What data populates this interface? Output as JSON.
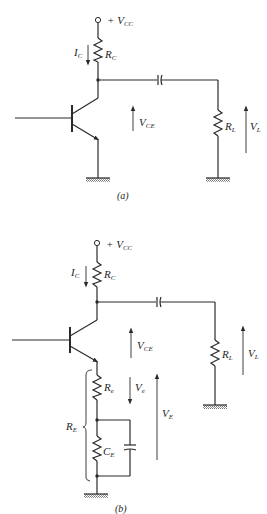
{
  "header": {
    "text": "Fig."
  },
  "figures": [
    {
      "id": "a",
      "caption": "(a)",
      "labels": {
        "vcc": {
          "main": "+ V",
          "sub": "CC"
        },
        "ic": {
          "main": "I",
          "sub": "C"
        },
        "rc": {
          "main": "R",
          "sub": "C"
        },
        "vce": {
          "main": "V",
          "sub": "CE"
        },
        "rl": {
          "main": "R",
          "sub": "L"
        },
        "vl": {
          "main": "V",
          "sub": "L"
        }
      }
    },
    {
      "id": "b",
      "caption": "(b)",
      "labels": {
        "vcc": {
          "main": "+ V",
          "sub": "CC"
        },
        "ic": {
          "main": "I",
          "sub": "C"
        },
        "rc": {
          "main": "R",
          "sub": "C"
        },
        "vce": {
          "main": "V",
          "sub": "CE"
        },
        "rl": {
          "main": "R",
          "sub": "L"
        },
        "vl": {
          "main": "V",
          "sub": "L"
        },
        "re_small": {
          "main": "R",
          "sub": "e"
        },
        "ve_small": {
          "main": "V",
          "sub": "e"
        },
        "re_total": {
          "main": "R",
          "sub": "E"
        },
        "ce": {
          "main": "C",
          "sub": "E"
        },
        "ve_total": {
          "main": "V",
          "sub": "E"
        }
      }
    }
  ],
  "colors": {
    "ink": "#2a2a2a",
    "ground_hatch": "#777777",
    "background": "#ffffff"
  }
}
